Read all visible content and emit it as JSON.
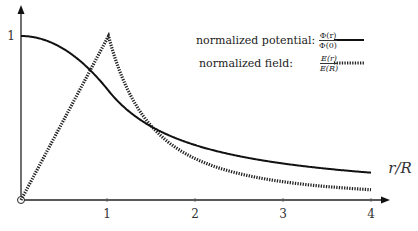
{
  "chart_data": {
    "type": "line",
    "title": "",
    "xlabel": "r/R",
    "ylabel": "",
    "xlim": [
      0,
      4
    ],
    "ylim": [
      0,
      1
    ],
    "x_ticks": [
      "1",
      "2",
      "3",
      "4"
    ],
    "y_ticks": [
      "1"
    ],
    "origin_marker": "open-circle",
    "grid": false,
    "legend_position": "upper right",
    "series": [
      {
        "name": "normalized potential",
        "formula_label": "Φ(r)/Φ(0)",
        "style": "solid",
        "x": [
          0,
          0.25,
          0.5,
          0.75,
          1.0,
          1.25,
          1.5,
          2.0,
          2.5,
          3.0,
          3.5,
          4.0
        ],
        "values": [
          1.0,
          0.979,
          0.917,
          0.813,
          0.667,
          0.533,
          0.444,
          0.333,
          0.267,
          0.222,
          0.19,
          0.167
        ]
      },
      {
        "name": "normalized field",
        "formula_label": "E(r)/E(R)",
        "style": "dotted",
        "x": [
          0,
          0.25,
          0.5,
          0.75,
          1.0,
          1.25,
          1.5,
          2.0,
          2.5,
          3.0,
          3.5,
          4.0
        ],
        "values": [
          0,
          0.25,
          0.5,
          0.75,
          1.0,
          0.64,
          0.444,
          0.25,
          0.16,
          0.111,
          0.082,
          0.0625
        ]
      }
    ]
  },
  "legend": {
    "potential_label": "normalized potential:",
    "potential_num": "Φ(r)",
    "potential_den": "Φ(0)",
    "field_label": "normalized field:",
    "field_num": "E(r)",
    "field_den": "E(R)"
  },
  "axes": {
    "xlabel": "r/R",
    "x_tick_1": "1",
    "x_tick_2": "2",
    "x_tick_3": "3",
    "x_tick_4": "4",
    "y_tick_1": "1"
  }
}
